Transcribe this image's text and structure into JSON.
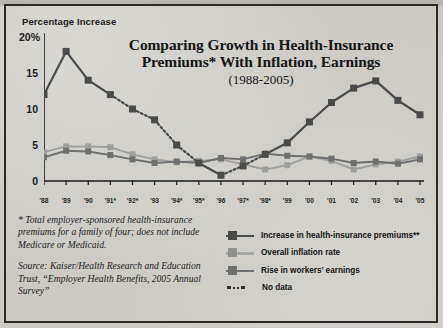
{
  "axis_title": "Percentage Increase",
  "title_line1": "Comparing Growth in Health-Insurance",
  "title_line2": "Premiums* With Inflation, Earnings",
  "subtitle": "(1988-2005)",
  "notes": {
    "footnote": "* Total employer-sponsored health-insurance premiums for a family of four; does not include Medicare or Medicaid.",
    "source": "Source: Kaiser/Health Research and Education Trust, “Employer Health Benefits, 2005 Annual Survey”"
  },
  "legend": {
    "items": [
      {
        "label": "Increase in health-insurance premiums**",
        "color": "#555555",
        "style": "solid-marker"
      },
      {
        "label": "Overall inflation rate",
        "color": "#9a9a9a",
        "style": "marker"
      },
      {
        "label": "Rise in workers’ earnings",
        "color": "#6d6d6d",
        "style": "solid-marker"
      },
      {
        "label": "No data",
        "color": "#2e2e2e",
        "style": "dotted"
      }
    ]
  },
  "colors": {
    "premiums": "#4a4a4a",
    "inflation": "#9e9e9e",
    "earnings": "#6f6f6f",
    "axis": "#1c1c1c",
    "background": "#cbc9c2"
  },
  "chart_data": {
    "type": "line",
    "title": "Comparing Growth in Health-Insurance Premiums* With Inflation, Earnings",
    "subtitle": "(1988-2005)",
    "xlabel": "",
    "ylabel": "Percentage Increase",
    "ylim": [
      0,
      20
    ],
    "yticks": [
      0,
      5,
      10,
      15,
      20
    ],
    "ytick_labels": [
      "0",
      "5",
      "10",
      "15",
      "20%"
    ],
    "grid": false,
    "legend_position": "bottom-right",
    "categories": [
      "'88",
      "'89",
      "'90",
      "'91*",
      "'92*",
      "'93",
      "'94*",
      "'95*",
      "'96",
      "'97*",
      "'98*",
      "'99",
      "'00",
      "'01",
      "'02",
      "'03",
      "'04",
      "'05"
    ],
    "x": [
      1988,
      1989,
      1990,
      1991,
      1992,
      1993,
      1994,
      1995,
      1996,
      1997,
      1998,
      1999,
      2000,
      2001,
      2002,
      2003,
      2004,
      2005
    ],
    "series": [
      {
        "name": "Increase in health-insurance premiums**",
        "color": "#4a4a4a",
        "values": [
          12.0,
          18.0,
          14.0,
          12.0,
          10.0,
          8.5,
          5.0,
          2.5,
          0.8,
          2.1,
          3.7,
          5.3,
          8.2,
          10.9,
          12.9,
          13.9,
          11.2,
          9.2
        ],
        "no_data_segments": [
          [
            1991,
            1995
          ],
          [
            1996,
            1998
          ]
        ]
      },
      {
        "name": "Overall inflation rate",
        "color": "#9e9e9e",
        "values": [
          4.0,
          4.8,
          4.8,
          4.7,
          3.7,
          3.0,
          2.6,
          2.8,
          3.0,
          2.3,
          1.6,
          2.2,
          3.4,
          2.8,
          1.6,
          2.3,
          2.7,
          3.4
        ]
      },
      {
        "name": "Rise in workers' earnings",
        "color": "#6f6f6f",
        "values": [
          3.3,
          4.2,
          4.1,
          3.6,
          3.0,
          2.5,
          2.7,
          2.5,
          3.2,
          3.0,
          3.8,
          3.5,
          3.4,
          3.1,
          2.5,
          2.7,
          2.4,
          3.0
        ]
      }
    ]
  }
}
